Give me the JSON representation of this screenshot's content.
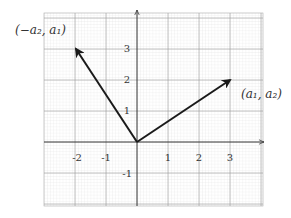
{
  "diagram": {
    "grid": {
      "xmin": -3,
      "xmax": 4,
      "ymin": -2,
      "ymax": 4,
      "minor_per_unit": 10
    },
    "x_ticks": [
      "-2",
      "-1",
      "1",
      "2",
      "3"
    ],
    "y_ticks": [
      "3",
      "2",
      "1",
      "-1"
    ],
    "vectors": [
      {
        "name": "a",
        "from": [
          0,
          0
        ],
        "to": [
          3,
          2
        ],
        "label": "(a₁, a₂)"
      },
      {
        "name": "perp",
        "from": [
          0,
          0
        ],
        "to": [
          -2,
          3
        ],
        "label": "(−a₂, a₁)"
      }
    ],
    "colors": {
      "grid_minor": "#d9d9d9",
      "grid_major": "#9a9a9a",
      "axis": "#333333",
      "vector": "#1a1a1a"
    }
  }
}
